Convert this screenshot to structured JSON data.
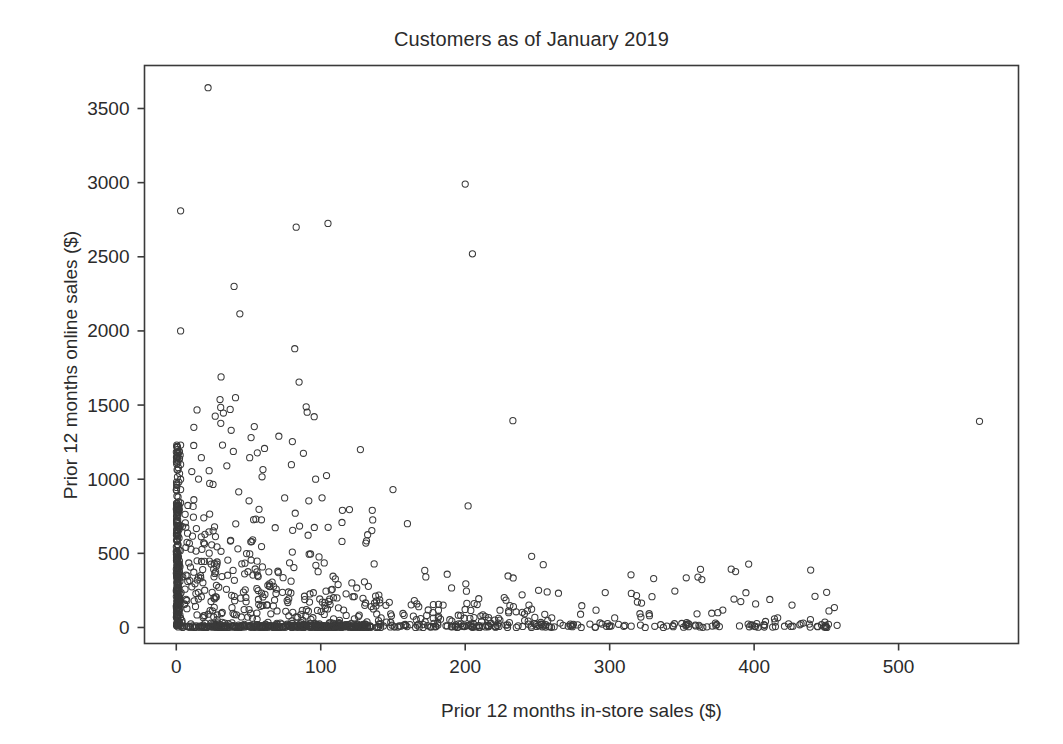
{
  "chart_data": {
    "type": "scatter",
    "title": "Customers as of January 2019",
    "xlabel": "Prior 12 months in-store sales ($)",
    "ylabel": "Prior 12 months online sales ($)",
    "xlim": [
      -22,
      583
    ],
    "ylim": [
      -108,
      3790
    ],
    "xticks": [
      0,
      100,
      200,
      300,
      400,
      500
    ],
    "xtick_labels": [
      "0",
      "100",
      "200",
      "300",
      "400",
      "500"
    ],
    "yticks": [
      0,
      500,
      1000,
      1500,
      2000,
      2500,
      3000,
      3500
    ],
    "ytick_labels": [
      "0",
      "500",
      "1000",
      "1500",
      "2000",
      "2500",
      "3000",
      "3500"
    ],
    "grid": false,
    "legend": null,
    "marker": {
      "shape": "open-circle",
      "radius": 3.1,
      "stroke": "#3a3a3a",
      "stroke_width": 1.05,
      "fill": "none"
    },
    "frame_color": "#3a3a3a",
    "background": "#ffffff",
    "n_points": 1180,
    "notable_points": [
      {
        "x": 22,
        "y": 3640
      },
      {
        "x": 200,
        "y": 2990
      },
      {
        "x": 3,
        "y": 2810
      },
      {
        "x": 105,
        "y": 2725
      },
      {
        "x": 83,
        "y": 2700
      },
      {
        "x": 205,
        "y": 2520
      },
      {
        "x": 40,
        "y": 2300
      },
      {
        "x": 44,
        "y": 2115
      },
      {
        "x": 3,
        "y": 2000
      },
      {
        "x": 82,
        "y": 1880
      },
      {
        "x": 31,
        "y": 1690
      },
      {
        "x": 85,
        "y": 1655
      },
      {
        "x": 41,
        "y": 1550
      },
      {
        "x": 233,
        "y": 1395
      },
      {
        "x": 556,
        "y": 1390
      },
      {
        "x": 54,
        "y": 1355
      },
      {
        "x": 38,
        "y": 1330
      },
      {
        "x": 71,
        "y": 1290
      },
      {
        "x": 3,
        "y": 1230
      },
      {
        "x": 32,
        "y": 1230
      },
      {
        "x": 88,
        "y": 1175
      },
      {
        "x": 3,
        "y": 1100
      },
      {
        "x": 35,
        "y": 1090
      },
      {
        "x": 60,
        "y": 1065
      },
      {
        "x": 104,
        "y": 1025
      },
      {
        "x": 3,
        "y": 1000
      },
      {
        "x": 3,
        "y": 930
      },
      {
        "x": 150,
        "y": 930
      },
      {
        "x": 202,
        "y": 820
      },
      {
        "x": 115,
        "y": 790
      },
      {
        "x": 160,
        "y": 700
      },
      {
        "x": 246,
        "y": 480
      },
      {
        "x": 172,
        "y": 385
      },
      {
        "x": 315,
        "y": 230
      },
      {
        "x": 434,
        "y": 30
      },
      {
        "x": 444,
        "y": 5
      },
      {
        "x": 371,
        "y": 10
      }
    ],
    "cluster_description": {
      "dense_vertical_band_x": 0,
      "dense_vertical_band_y_range": [
        0,
        1230
      ],
      "dense_horizontal_band_y": 0,
      "dense_horizontal_band_x_range": [
        0,
        135
      ]
    }
  },
  "axis": {
    "tick_length": 7,
    "tick_color": "#3a3a3a"
  }
}
